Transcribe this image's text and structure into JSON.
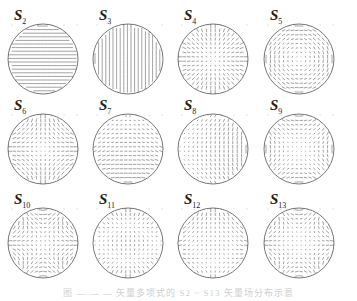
{
  "figure": {
    "panels": [
      {
        "id": "S2",
        "label": "S",
        "sub": "2",
        "pattern": "horizontal"
      },
      {
        "id": "S3",
        "label": "S",
        "sub": "3",
        "pattern": "vertical"
      },
      {
        "id": "S4",
        "label": "S",
        "sub": "4",
        "pattern": "radial"
      },
      {
        "id": "S5",
        "label": "S",
        "sub": "5",
        "pattern": "rotational"
      },
      {
        "id": "S6",
        "label": "S",
        "sub": "6",
        "pattern": "saddle"
      },
      {
        "id": "S7",
        "label": "S",
        "sub": "7",
        "pattern": "tilt-x"
      },
      {
        "id": "S8",
        "label": "S",
        "sub": "8",
        "pattern": "tilt-y"
      },
      {
        "id": "S9",
        "label": "S",
        "sub": "9",
        "pattern": "astig"
      },
      {
        "id": "S10",
        "label": "S",
        "sub": "10",
        "pattern": "trefoil"
      },
      {
        "id": "S11",
        "label": "S",
        "sub": "11",
        "pattern": "coma"
      },
      {
        "id": "S12",
        "label": "S",
        "sub": "12",
        "pattern": "quad"
      },
      {
        "id": "S13",
        "label": "S",
        "sub": "13",
        "pattern": "diag"
      }
    ],
    "caption": "图 — — — 矢量多项式的 S2 ~ S13 矢量场分布示意"
  }
}
